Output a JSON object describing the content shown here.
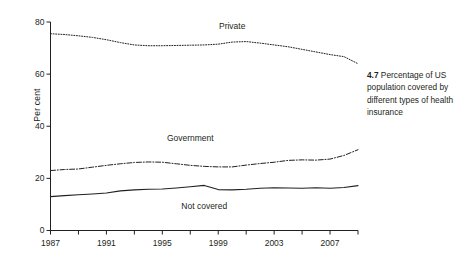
{
  "caption": {
    "figure_number": "4.7",
    "text": "Percentage of US population covered by different types of health insurance"
  },
  "chart_data": {
    "type": "line",
    "title": "",
    "xlabel": "",
    "ylabel": "Per cent",
    "xlim": [
      1987,
      2009
    ],
    "ylim": [
      0,
      80
    ],
    "grid": false,
    "legend_position": "inline-labels",
    "y_ticks": [
      0,
      20,
      40,
      60,
      80
    ],
    "y_tick_labels": [
      "0",
      "20",
      "40",
      "60",
      "80"
    ],
    "x_ticks": [
      1987,
      1989,
      1991,
      1993,
      1995,
      1997,
      1999,
      2001,
      2003,
      2005,
      2007,
      2009
    ],
    "x_tick_labels_major": [
      "1987",
      "1991",
      "1995",
      "1999",
      "2003",
      "2007"
    ],
    "x_major_ticks": [
      1987,
      1991,
      1995,
      1999,
      2003,
      2007
    ],
    "x": [
      1987,
      1988,
      1989,
      1990,
      1991,
      1992,
      1993,
      1994,
      1995,
      1996,
      1997,
      1998,
      1999,
      2000,
      2001,
      2002,
      2003,
      2004,
      2005,
      2006,
      2007,
      2008,
      2009
    ],
    "series": [
      {
        "name": "Private",
        "style": "dotted",
        "color": "#231f20",
        "values": [
          75.5,
          75.2,
          74.7,
          74.1,
          73.2,
          72.1,
          71.2,
          70.9,
          70.9,
          71.0,
          71.1,
          71.2,
          71.5,
          72.3,
          72.5,
          71.9,
          71.2,
          70.5,
          69.5,
          68.5,
          67.5,
          66.7,
          64.0
        ]
      },
      {
        "name": "Government",
        "style": "dash-dot",
        "color": "#231f20",
        "values": [
          23.0,
          23.4,
          23.6,
          24.3,
          25.0,
          25.6,
          26.1,
          26.3,
          26.2,
          25.6,
          25.0,
          24.6,
          24.4,
          24.4,
          25.1,
          25.7,
          26.2,
          26.9,
          27.1,
          27.0,
          27.4,
          28.8,
          31.0
        ]
      },
      {
        "name": "Not covered",
        "style": "solid",
        "color": "#231f20",
        "values": [
          13.0,
          13.4,
          13.7,
          14.0,
          14.4,
          15.2,
          15.6,
          15.8,
          15.9,
          16.3,
          16.8,
          17.3,
          15.7,
          15.6,
          15.8,
          16.2,
          16.4,
          16.3,
          16.2,
          16.4,
          16.2,
          16.5,
          17.2
        ]
      }
    ],
    "annotations": [
      {
        "label": "Private",
        "x": 2000,
        "y": 78
      },
      {
        "label": "Government",
        "x": 1997,
        "y": 35
      },
      {
        "label": "Not covered",
        "x": 1998,
        "y": 9
      }
    ]
  }
}
